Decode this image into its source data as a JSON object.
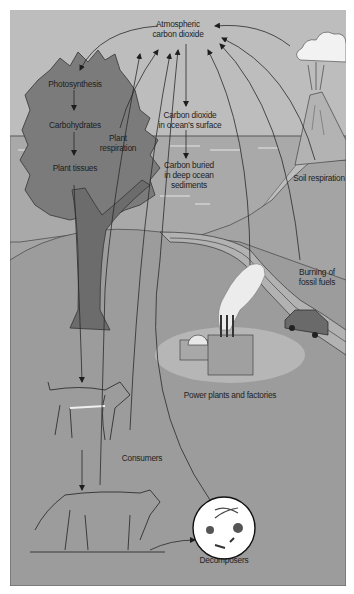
{
  "diagram": {
    "type": "carbon-cycle",
    "colors": {
      "sky": "#bdbdbd",
      "ocean": "#a9a9a9",
      "hill": "#a4a4a4",
      "land": "#9c9c9c",
      "tree_canopy": "#7b7b7b",
      "tree_trunk": "#6c6c6c",
      "cloud": "#f2f2f2",
      "line": "#2a2a2a"
    },
    "labels": {
      "atmospheric": [
        "Atmospheric",
        "carbon dioxide"
      ],
      "photosynthesis": "Photosynthesis",
      "carbohydrates": "Carbohydrates",
      "plant_tissues": "Plant tissues",
      "plant_respiration": [
        "Plant",
        "respiration"
      ],
      "co2_ocean_surface": [
        "Carbon dioxide",
        "in ocean's surface"
      ],
      "carbon_buried": [
        "Carbon buried",
        "in deep ocean",
        "sediments"
      ],
      "soil_respiration": "Soil respiration",
      "burning_fossil_fuels": [
        "Burning of",
        "fossil fuels"
      ],
      "power_plants": "Power plants and factories",
      "consumers": "Consumers",
      "decomposers": "Decomposers"
    },
    "icons": [
      "tree-icon",
      "volcano-icon",
      "cloud-icon",
      "car-icon",
      "factory-icon",
      "deer-icon",
      "cougar-icon",
      "decomposers-circle-icon"
    ]
  }
}
